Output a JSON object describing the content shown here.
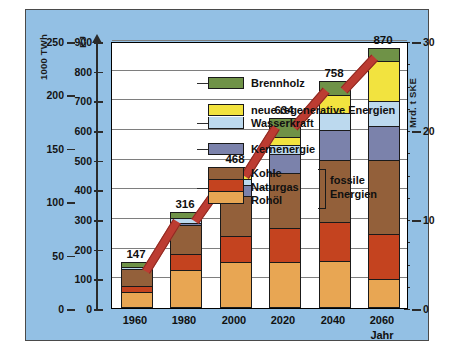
{
  "chart_data": {
    "type": "bar",
    "title": "",
    "stacked": true,
    "categories": [
      "1960",
      "1980",
      "2000",
      "2020",
      "2040",
      "2060"
    ],
    "xlabel": "Jahr",
    "ylabel": "EJ",
    "ylabel_left_secondary": "1000 TWh",
    "ylabel_right": "Mrd. t SKE",
    "ylim": [
      0,
      900
    ],
    "yticks": [
      0,
      100,
      200,
      300,
      400,
      500,
      600,
      700,
      800,
      900
    ],
    "ylim_left_secondary": [
      0,
      250
    ],
    "yticks_left_secondary": [
      0,
      50,
      100,
      150,
      200,
      250
    ],
    "ylim_right": [
      0,
      30
    ],
    "yticks_right": [
      0,
      10,
      20,
      30
    ],
    "grid": true,
    "legend_position": "inside-top-left",
    "totals": [
      147,
      316,
      468,
      634,
      758,
      870
    ],
    "series": [
      {
        "name": "Rohöl",
        "color": "#e8a653",
        "values": [
          50,
          125,
          150,
          150,
          155,
          95
        ]
      },
      {
        "name": "Naturgas",
        "color": "#c4431f",
        "values": [
          22,
          55,
          90,
          115,
          130,
          150
        ]
      },
      {
        "name": "Kohle",
        "color": "#93603a",
        "values": [
          55,
          95,
          135,
          185,
          210,
          250
        ]
      },
      {
        "name": "Kernenergie",
        "color": "#7b82ab",
        "values": [
          0,
          8,
          35,
          65,
          100,
          115
        ]
      },
      {
        "name": "Wasserkraft",
        "color": "#bcd9ee",
        "values": [
          8,
          18,
          22,
          32,
          60,
          85
        ]
      },
      {
        "name": "neue regenerative Energien",
        "color": "#f2e33f",
        "values": [
          0,
          0,
          12,
          25,
          60,
          135
        ]
      },
      {
        "name": "Brennholz",
        "color": "#6f9247",
        "values": [
          12,
          15,
          24,
          62,
          43,
          40
        ]
      }
    ],
    "trend_line": {
      "name": "trend",
      "color": "#bc3c32"
    }
  },
  "legend": {
    "items": [
      {
        "label": "Brennholz"
      },
      {
        "label": "neue regenerative Energien"
      },
      {
        "label": "Wasserkraft"
      },
      {
        "label": "Kernenergie"
      },
      {
        "label": "Kohle"
      },
      {
        "label": "Naturgas"
      },
      {
        "label": "Rohöl"
      }
    ],
    "group_label_line1": "fossile",
    "group_label_line2": "Energien"
  },
  "axes": {
    "left_outer_title": "1000 TWh",
    "left_inner_title": "EJ",
    "right_title": "Mrd. t SKE",
    "x_title": "Jahr",
    "left_outer_ticks": [
      "250",
      "200",
      "150",
      "100",
      "50",
      "0"
    ],
    "left_inner_ticks": [
      "900",
      "800",
      "700",
      "600",
      "500",
      "400",
      "300",
      "200",
      "100",
      "0"
    ],
    "right_ticks": [
      "30",
      "20",
      "10",
      "0"
    ],
    "x_ticks": [
      "1960",
      "1980",
      "2000",
      "2020",
      "2040",
      "2060"
    ]
  },
  "colors": {
    "panel_background": "#93c0e4",
    "plot_background": "#ffffff",
    "frame": "#4a4a4a",
    "gridline": "#7e7e7e",
    "trend": "#bc3c32"
  }
}
